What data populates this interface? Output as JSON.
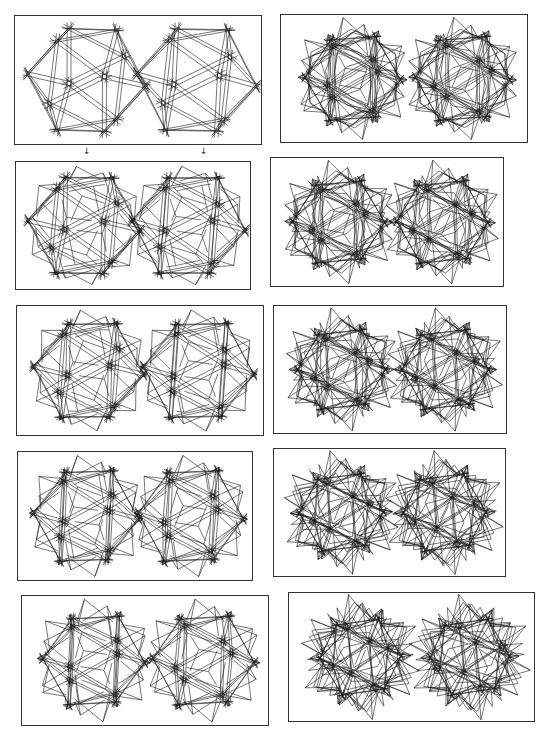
{
  "figure": {
    "stroke_color": "#1a1a1a",
    "border_color": "#333333",
    "arrows": [
      {
        "glyph": "↓",
        "x": 83,
        "y": 147
      },
      {
        "glyph": "↓",
        "x": 200,
        "y": 147
      }
    ],
    "panels": [
      {
        "id": "left-1",
        "column": "left",
        "x": 14,
        "y": 15,
        "w": 248,
        "h": 130,
        "stellation": 0.0,
        "cage": 1.0,
        "rot": 0.0
      },
      {
        "id": "left-2",
        "column": "left",
        "x": 15,
        "y": 161,
        "w": 236,
        "h": 129,
        "stellation": 0.12,
        "cage": 1.0,
        "rot": 0.05
      },
      {
        "id": "left-3",
        "column": "left",
        "x": 16,
        "y": 305,
        "w": 248,
        "h": 131,
        "stellation": 0.22,
        "cage": 1.0,
        "rot": 0.1
      },
      {
        "id": "left-4",
        "column": "left",
        "x": 17,
        "y": 451,
        "w": 236,
        "h": 130,
        "stellation": 0.32,
        "cage": 0.9,
        "rot": 0.15
      },
      {
        "id": "left-5",
        "column": "left",
        "x": 21,
        "y": 595,
        "w": 248,
        "h": 131,
        "stellation": 0.42,
        "cage": 0.8,
        "rot": 0.2
      },
      {
        "id": "right-1",
        "column": "right",
        "x": 280,
        "y": 14,
        "w": 248,
        "h": 129,
        "stellation": 0.55,
        "cage": 0.7,
        "rot": 0.25
      },
      {
        "id": "right-2",
        "column": "right",
        "x": 270,
        "y": 157,
        "w": 234,
        "h": 130,
        "stellation": 0.65,
        "cage": 0.6,
        "rot": 0.3
      },
      {
        "id": "right-3",
        "column": "right",
        "x": 273,
        "y": 305,
        "w": 234,
        "h": 129,
        "stellation": 0.75,
        "cage": 0.5,
        "rot": 0.35
      },
      {
        "id": "right-4",
        "column": "right",
        "x": 273,
        "y": 448,
        "w": 233,
        "h": 129,
        "stellation": 0.85,
        "cage": 0.4,
        "rot": 0.4
      },
      {
        "id": "right-5",
        "column": "right",
        "x": 288,
        "y": 592,
        "w": 247,
        "h": 130,
        "stellation": 0.95,
        "cage": 0.3,
        "rot": 0.45
      }
    ],
    "stereo": {
      "left_center_frac": 0.29,
      "right_center_frac": 0.74,
      "radius_frac": 0.47,
      "eye_angle": 0.09
    }
  }
}
